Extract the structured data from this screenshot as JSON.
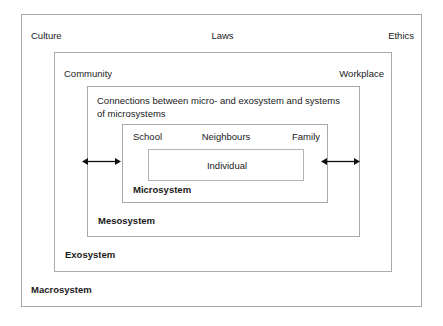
{
  "diagram": {
    "colors": {
      "border": "#a9a9a9",
      "inner_border": "#b4b4b4",
      "background": "#ffffff",
      "text": "#1a1a1a"
    },
    "macrosystem": {
      "name": "Macrosystem",
      "labels": {
        "left": "Culture",
        "center": "Laws",
        "right": "Ethics"
      }
    },
    "exosystem": {
      "name": "Exosystem",
      "labels": {
        "left": "Community",
        "right": "Workplace"
      }
    },
    "mesosystem": {
      "name": "Mesosystem",
      "caption": "Connections between micro- and exosystem and systems of microsystems"
    },
    "microsystem": {
      "name": "Microsystem",
      "labels": {
        "left": "School",
        "center": "Neighbours",
        "right": "Family"
      }
    },
    "individual": {
      "name": "Individual"
    },
    "arrows": [
      {
        "name": "left-bidirectional-arrow",
        "direction": "both"
      },
      {
        "name": "right-bidirectional-arrow",
        "direction": "both"
      }
    ]
  }
}
